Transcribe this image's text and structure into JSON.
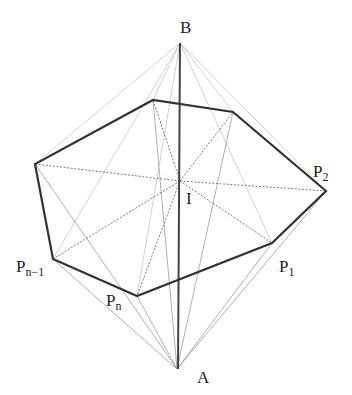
{
  "diagram": {
    "points": {
      "B": {
        "label": "B",
        "x": 180,
        "y": 43
      },
      "A": {
        "label": "A",
        "x": 177,
        "y": 369
      },
      "I": {
        "label": "I",
        "x": 180,
        "y": 181
      }
    },
    "polygon": [
      {
        "id": "P2",
        "x": 326,
        "y": 191
      },
      {
        "id": "Ptop_r",
        "x": 233,
        "y": 112
      },
      {
        "id": "Ptop_l",
        "x": 153,
        "y": 100
      },
      {
        "id": "Pleft",
        "x": 35,
        "y": 164
      },
      {
        "id": "Pn-1",
        "x": 53,
        "y": 259
      },
      {
        "id": "Pn",
        "x": 137,
        "y": 296
      },
      {
        "id": "P1",
        "x": 272,
        "y": 243
      }
    ],
    "labels": {
      "B": "B",
      "A": "A",
      "I": "I",
      "P2_main": "P",
      "P2_sub": "2",
      "P1_main": "P",
      "P1_sub": "1",
      "Pn1_main": "P",
      "Pn1_sub": "n−1",
      "Pn_main": "P",
      "Pn_sub": "n"
    },
    "colors": {
      "polygon_edge": "#333333",
      "apex_edge": "#9a9a9a",
      "center_edge": "#555555",
      "axis": "#444444"
    }
  }
}
